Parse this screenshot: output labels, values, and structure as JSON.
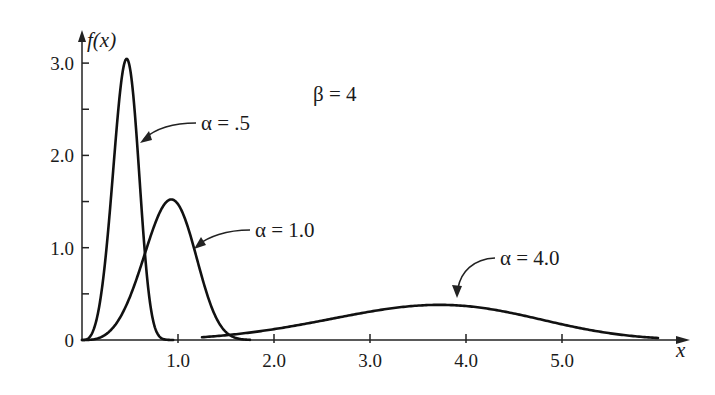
{
  "chart_data": {
    "type": "line",
    "title": "",
    "xlabel": "x",
    "ylabel": "f(x)",
    "xlim": [
      0,
      6.3
    ],
    "ylim": [
      0,
      3.2
    ],
    "grid": false,
    "legend": "none (inline arrow annotations)",
    "distribution": "Weibull density f(x) = (beta/alpha)(x/alpha)^(beta-1) exp(-(x/alpha)^beta)",
    "x_ticks": [
      {
        "value": 1.0,
        "label": "1.0"
      },
      {
        "value": 2.0,
        "label": "2.0"
      },
      {
        "value": 3.0,
        "label": "3.0"
      },
      {
        "value": 4.0,
        "label": "4.0"
      },
      {
        "value": 5.0,
        "label": "5.0"
      }
    ],
    "x_minor_ticks": [],
    "y_ticks": [
      {
        "value": 0,
        "label": "0"
      },
      {
        "value": 1.0,
        "label": "1.0"
      },
      {
        "value": 2.0,
        "label": "2.0"
      },
      {
        "value": 3.0,
        "label": "3.0"
      }
    ],
    "y_minor_ticks": [
      0.5,
      1.5,
      2.5
    ],
    "parameter_annotation": "β = 4",
    "series": [
      {
        "name": "α = .5",
        "alpha": 0.5,
        "beta": 4,
        "x_range": [
          0,
          0.95
        ],
        "peak": {
          "x": 0.47,
          "y": 3.04
        },
        "x": [
          0,
          0.1,
          0.2,
          0.3,
          0.4,
          0.47,
          0.55,
          0.6,
          0.7,
          0.8,
          0.9
        ],
        "y": [
          0,
          0.06,
          0.5,
          1.52,
          2.7,
          3.04,
          2.69,
          2.18,
          0.87,
          0.16,
          0.01
        ]
      },
      {
        "name": "α = 1.0",
        "alpha": 1.0,
        "beta": 4,
        "x_range": [
          0,
          1.75
        ],
        "peak": {
          "x": 0.93,
          "y": 1.52
        },
        "x": [
          0,
          0.2,
          0.4,
          0.6,
          0.8,
          0.93,
          1.0,
          1.2,
          1.4,
          1.6,
          1.75
        ],
        "y": [
          0,
          0.03,
          0.25,
          0.76,
          1.36,
          1.52,
          1.47,
          0.87,
          0.24,
          0.02,
          0.0
        ]
      },
      {
        "name": "α = 4.0",
        "alpha": 4.0,
        "beta": 4,
        "x_range": [
          1.25,
          6.0
        ],
        "peak": {
          "x": 3.8,
          "y": 0.4
        },
        "x": [
          1.25,
          2.0,
          2.5,
          3.0,
          3.5,
          3.8,
          4.0,
          4.5,
          5.0,
          5.5,
          6.0
        ],
        "y": [
          0.03,
          0.12,
          0.21,
          0.31,
          0.38,
          0.4,
          0.39,
          0.3,
          0.18,
          0.08,
          0.03
        ]
      }
    ],
    "annotations": [
      {
        "text": "α = .5",
        "target_series": 0
      },
      {
        "text": "α = 1.0",
        "target_series": 1
      },
      {
        "text": "α = 4.0",
        "target_series": 2
      }
    ]
  },
  "layout": {
    "origin_px": [
      82,
      340
    ],
    "px_per_x_unit": 96,
    "px_per_y_unit": 92.3,
    "x_axis_end_px": 688,
    "y_axis_top_px": 30,
    "curve_color": "#111111"
  },
  "labels": {
    "y_axis": "f(x)",
    "x_axis": "x",
    "beta": "β = 4",
    "alpha_05": "α = .5",
    "alpha_10": "α = 1.0",
    "alpha_40": "α = 4.0"
  }
}
